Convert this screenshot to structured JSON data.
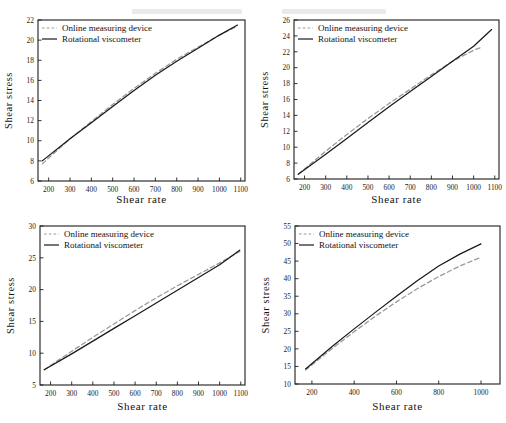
{
  "figure": {
    "title": "",
    "layout": "2x2 grid of line charts",
    "legend_entries": [
      {
        "label": "Online measuring device",
        "style": "dashed",
        "color": "#9a9a9a"
      },
      {
        "label": "Rotational viscometer",
        "style": "solid",
        "color": "#1a1a1a"
      }
    ]
  },
  "chart_data": [
    {
      "type": "line",
      "panel": "top-left",
      "title": "",
      "xlabel": "Shear rate",
      "ylabel": "Shear stress",
      "xlim": [
        150,
        1120
      ],
      "ylim": [
        6,
        22
      ],
      "xticks": [
        200,
        300,
        400,
        500,
        600,
        700,
        800,
        900,
        1000,
        1100
      ],
      "yticks": [
        6,
        8,
        10,
        12,
        14,
        16,
        18,
        20,
        22
      ],
      "grid": false,
      "legend_position": "upper-left-inside",
      "series": [
        {
          "name": "Online measuring device",
          "style": "dashed",
          "color": "#9a9a9a",
          "x": [
            170,
            300,
            400,
            500,
            600,
            700,
            800,
            900,
            1000,
            1085
          ],
          "values": [
            7.7,
            10.2,
            11.9,
            13.6,
            15.2,
            16.7,
            18.1,
            19.3,
            20.5,
            21.4
          ]
        },
        {
          "name": "Rotational viscometer",
          "style": "solid",
          "color": "#1a1a1a",
          "x": [
            170,
            300,
            400,
            500,
            600,
            700,
            800,
            900,
            1000,
            1085
          ],
          "values": [
            8.0,
            10.2,
            11.8,
            13.4,
            15.0,
            16.5,
            17.9,
            19.2,
            20.5,
            21.5
          ]
        }
      ]
    },
    {
      "type": "line",
      "panel": "top-right",
      "title": "",
      "xlabel": "Shear rate",
      "ylabel": "Shear stress",
      "xlim": [
        150,
        1120
      ],
      "ylim": [
        6,
        26
      ],
      "xticks": [
        200,
        300,
        400,
        500,
        600,
        700,
        800,
        900,
        1000,
        1100
      ],
      "yticks": [
        6,
        8,
        10,
        12,
        14,
        16,
        18,
        20,
        22,
        24,
        26
      ],
      "grid": false,
      "legend_position": "upper-left-inside",
      "series": [
        {
          "name": "Online measuring device",
          "style": "dashed",
          "color": "#9a9a9a",
          "x": [
            170,
            300,
            400,
            500,
            600,
            700,
            800,
            900,
            1000,
            1030
          ],
          "values": [
            6.6,
            9.5,
            11.6,
            13.6,
            15.5,
            17.3,
            19.1,
            20.8,
            22.2,
            22.5
          ]
        },
        {
          "name": "Rotational viscometer",
          "style": "solid",
          "color": "#1a1a1a",
          "x": [
            170,
            300,
            400,
            500,
            600,
            700,
            800,
            900,
            1000,
            1085
          ],
          "values": [
            6.6,
            9.1,
            11.1,
            13.1,
            15.1,
            17.0,
            18.9,
            20.8,
            22.7,
            24.8
          ]
        }
      ]
    },
    {
      "type": "line",
      "panel": "bottom-left",
      "title": "",
      "xlabel": "Shear rate",
      "ylabel": "Shear stress",
      "xlim": [
        150,
        1120
      ],
      "ylim": [
        5,
        30
      ],
      "xticks": [
        200,
        300,
        400,
        500,
        600,
        700,
        800,
        900,
        1000,
        1100
      ],
      "yticks": [
        5,
        10,
        15,
        20,
        25,
        30
      ],
      "grid": false,
      "legend_position": "upper-left-inside",
      "series": [
        {
          "name": "Online measuring device",
          "style": "dashed",
          "color": "#9a9a9a",
          "x": [
            170,
            300,
            400,
            500,
            600,
            700,
            800,
            900,
            1000,
            1095
          ],
          "values": [
            7.4,
            10.3,
            12.5,
            14.6,
            16.7,
            18.7,
            20.6,
            22.4,
            24.2,
            26.0
          ]
        },
        {
          "name": "Rotational viscometer",
          "style": "solid",
          "color": "#1a1a1a",
          "x": [
            170,
            300,
            400,
            500,
            600,
            700,
            800,
            900,
            1000,
            1095
          ],
          "values": [
            7.4,
            9.9,
            11.9,
            13.9,
            15.9,
            17.9,
            19.9,
            21.9,
            23.9,
            26.2
          ]
        }
      ]
    },
    {
      "type": "line",
      "panel": "bottom-right",
      "title": "",
      "xlabel": "Shear rate",
      "ylabel": "Shear stress",
      "xlim": [
        120,
        1090
      ],
      "ylim": [
        10,
        55
      ],
      "xticks": [
        200,
        400,
        600,
        800,
        1000
      ],
      "yticks": [
        10,
        15,
        20,
        25,
        30,
        35,
        40,
        45,
        50,
        55
      ],
      "grid": false,
      "legend_position": "upper-left-inside",
      "series": [
        {
          "name": "Online measuring device",
          "style": "dashed",
          "color": "#9a9a9a",
          "x": [
            170,
            300,
            400,
            500,
            600,
            700,
            800,
            900,
            1000
          ],
          "values": [
            14.0,
            20.3,
            24.9,
            29.3,
            33.4,
            37.2,
            40.6,
            43.6,
            46.1
          ]
        },
        {
          "name": "Rotational viscometer",
          "style": "solid",
          "color": "#1a1a1a",
          "x": [
            170,
            300,
            400,
            500,
            600,
            700,
            800,
            900,
            1000
          ],
          "values": [
            14.3,
            20.9,
            25.7,
            30.4,
            35.0,
            39.5,
            43.6,
            47.0,
            49.9
          ]
        }
      ]
    }
  ]
}
